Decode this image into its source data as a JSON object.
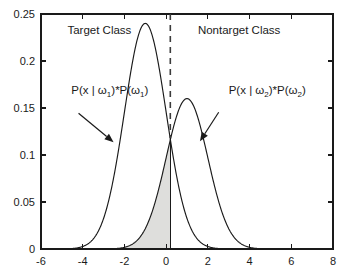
{
  "chart_data": {
    "type": "line",
    "title": "",
    "xlabel": "",
    "ylabel": "",
    "xlim": [
      -6,
      8
    ],
    "ylim": [
      0,
      0.25
    ],
    "grid": false,
    "legend_position": "none",
    "x_ticks": [
      "-6",
      "-4",
      "-2",
      "0",
      "2",
      "4",
      "6",
      "8"
    ],
    "x_tick_values": [
      -6,
      -4,
      -2,
      0,
      2,
      4,
      6,
      8
    ],
    "y_ticks": [
      "0",
      "0.05",
      "0.1",
      "0.15",
      "0.2",
      "0.25"
    ],
    "y_tick_values": [
      0,
      0.05,
      0.1,
      0.15,
      0.2,
      0.25
    ],
    "series": [
      {
        "name": "Target Class",
        "distribution": "gaussian",
        "mean": -1.0,
        "sigma": 1.0,
        "prior": 0.6,
        "peak_value": 0.24,
        "peak_x": -1.0
      },
      {
        "name": "Nontarget Class",
        "distribution": "gaussian",
        "mean": 1.0,
        "sigma": 1.0,
        "prior": 0.4,
        "peak_value": 0.16,
        "peak_x": 1.0
      }
    ],
    "threshold": {
      "x": 0.2,
      "y_intersection": 0.118,
      "dashed_from_y": 0.25,
      "dashed_to_y": 0.118,
      "solid_from_y": 0.118,
      "solid_to_y": 0
    },
    "shaded_region": {
      "label": "error region",
      "series": "Nontarget Class",
      "x_from": -6,
      "x_to": 0.2,
      "color": "#dededc"
    },
    "annotations": [
      {
        "name": "target-class-title",
        "text": "Target Class",
        "x": -3.2,
        "y": 0.2285
      },
      {
        "name": "nontarget-class-title",
        "text": "Nontarget Class",
        "x": 3.5,
        "y": 0.2285
      },
      {
        "name": "target-pdf-label",
        "text": "P(x | ω₁)*P(ω₁)",
        "x": -4.55,
        "y": 0.1645
      },
      {
        "name": "nontarget-pdf-label",
        "text": "P(x | ω₂)*P(ω₂)",
        "x": 3.0,
        "y": 0.1645
      }
    ],
    "label_parts": {
      "target_pdf": {
        "prefix": "P(x | ω",
        "sub1": "1",
        "middle": ")*P(ω",
        "sub2": "1",
        "suffix": ")"
      },
      "nontarget_pdf": {
        "prefix": "P(x | ω",
        "sub1": "2",
        "middle": ")*P(ω",
        "sub2": "2",
        "suffix": ")"
      }
    },
    "arrows": [
      {
        "name": "target-label-arrow",
        "from_x": -4.2,
        "from_y": 0.1445,
        "to_x": -2.52,
        "to_y": 0.1135
      },
      {
        "name": "nontarget-label-arrow",
        "from_x": 2.52,
        "from_y": 0.1455,
        "to_x": 1.62,
        "to_y": 0.1145
      }
    ],
    "colors": {
      "curve": "#1a1a1a",
      "shade": "#dededc",
      "axis": "#1a1a1a",
      "threshold_dashed": "#3b3b3b",
      "background": "#ffffff"
    }
  }
}
